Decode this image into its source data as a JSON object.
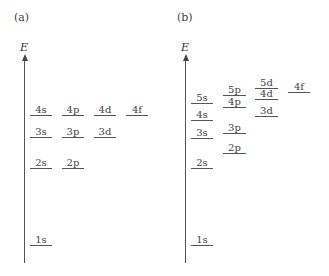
{
  "panels": [
    {
      "id": "a",
      "label": "(a)",
      "axis_label": "E",
      "label_x": 14,
      "label_y": 11,
      "axis_x": 24,
      "axis_top": 58,
      "axis_bottom": 263,
      "levels": [
        {
          "name": "1s",
          "x": 30,
          "y": 245,
          "w": 22
        },
        {
          "name": "2s",
          "x": 30,
          "y": 168,
          "w": 22
        },
        {
          "name": "2p",
          "x": 62,
          "y": 168,
          "w": 22
        },
        {
          "name": "3s",
          "x": 30,
          "y": 137,
          "w": 22
        },
        {
          "name": "3p",
          "x": 62,
          "y": 137,
          "w": 22
        },
        {
          "name": "3d",
          "x": 94,
          "y": 137,
          "w": 22
        },
        {
          "name": "4s",
          "x": 30,
          "y": 115,
          "w": 22
        },
        {
          "name": "4p",
          "x": 62,
          "y": 115,
          "w": 22
        },
        {
          "name": "4d",
          "x": 94,
          "y": 115,
          "w": 22
        },
        {
          "name": "4f",
          "x": 126,
          "y": 115,
          "w": 22
        }
      ]
    },
    {
      "id": "b",
      "label": "(b)",
      "axis_label": "E",
      "label_x": 177,
      "label_y": 11,
      "axis_x": 185,
      "axis_top": 58,
      "axis_bottom": 263,
      "levels": [
        {
          "name": "1s",
          "x": 191,
          "y": 245,
          "w": 22
        },
        {
          "name": "2s",
          "x": 191,
          "y": 168,
          "w": 22
        },
        {
          "name": "3s",
          "x": 191,
          "y": 138,
          "w": 22
        },
        {
          "name": "4s",
          "x": 191,
          "y": 120,
          "w": 22
        },
        {
          "name": "5s",
          "x": 191,
          "y": 103,
          "w": 22
        },
        {
          "name": "2p",
          "x": 223,
          "y": 153,
          "w": 23
        },
        {
          "name": "3p",
          "x": 223,
          "y": 133,
          "w": 23
        },
        {
          "name": "4p",
          "x": 223,
          "y": 107,
          "w": 23
        },
        {
          "name": "5p",
          "x": 223,
          "y": 95,
          "w": 23
        },
        {
          "name": "3d",
          "x": 255,
          "y": 116,
          "w": 23
        },
        {
          "name": "4d",
          "x": 255,
          "y": 99,
          "w": 23
        },
        {
          "name": "5d",
          "x": 255,
          "y": 88,
          "w": 23
        },
        {
          "name": "4f",
          "x": 288,
          "y": 92,
          "w": 22
        }
      ]
    }
  ]
}
